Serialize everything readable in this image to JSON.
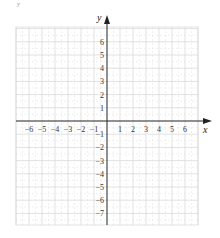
{
  "corner_mark": "y",
  "chart_data": {
    "type": "coordinate-grid",
    "title": "",
    "xlabel": "x",
    "ylabel": "y",
    "xlim": [
      -7,
      7
    ],
    "ylim": [
      -8,
      7
    ],
    "grid": true,
    "x_tick_labels": [
      "−6",
      "−5",
      "−4",
      "−3",
      "−2",
      "−1",
      "1",
      "2",
      "3",
      "4",
      "5",
      "6"
    ],
    "x_tick_values": [
      -6,
      -5,
      -4,
      -3,
      -2,
      -1,
      1,
      2,
      3,
      4,
      5,
      6
    ],
    "y_tick_labels": [
      "6",
      "5",
      "4",
      "3",
      "2",
      "1",
      "−1",
      "−2",
      "−3",
      "−4",
      "−5",
      "−6",
      "−7"
    ],
    "y_tick_values": [
      6,
      5,
      4,
      3,
      2,
      1,
      -1,
      -2,
      -3,
      -4,
      -5,
      -6,
      -7
    ],
    "colors": {
      "axis": "#222222",
      "grid": "#d6d6d6",
      "grid_minor": "#e6e6e6",
      "labels": "#333333"
    }
  }
}
